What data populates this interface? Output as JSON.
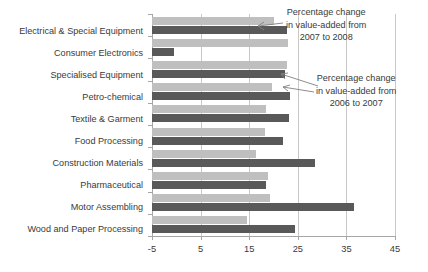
{
  "chart_data": {
    "type": "bar",
    "orientation": "horizontal",
    "title": "",
    "xlabel": "",
    "ylabel": "",
    "xlim": [
      -5,
      45
    ],
    "xticks": [
      -5,
      5,
      15,
      25,
      35,
      45
    ],
    "grid": true,
    "legend": "none",
    "categories": [
      "Electrical & Special Equipment",
      "Consumer Electronics",
      "Specialised Equipment",
      "Petro-chemical",
      "Textile & Garment",
      "Food Processing",
      "Construction Materials",
      "Pharmaceutical",
      "Motor Assembling",
      "Wood and Paper Processing"
    ],
    "series": [
      {
        "name": "Percentage change in value-added from 2006 to 2007",
        "color": "#bfbfbf",
        "values": [
          20.0,
          23.0,
          22.8,
          19.6,
          18.5,
          18.3,
          16.5,
          18.9,
          19.3,
          14.5
        ]
      },
      {
        "name": "Percentage change in value-added from 2007 to 2008",
        "color": "#595959",
        "values": [
          22.8,
          -0.5,
          22.4,
          23.3,
          23.2,
          22.0,
          28.5,
          18.5,
          36.6,
          24.5
        ]
      }
    ],
    "annotations": [
      {
        "id": "annot-2007-2008",
        "lines": [
          "Percentage change",
          "in value-added from",
          "2007 to 2008"
        ],
        "points_to": "dark-bar-electrical-special-equipment"
      },
      {
        "id": "annot-2006-2007",
        "lines": [
          "Percentage change",
          "in value-added from",
          "2006 to 2007"
        ],
        "points_to": "light-bar-specialised-equipment"
      }
    ]
  }
}
